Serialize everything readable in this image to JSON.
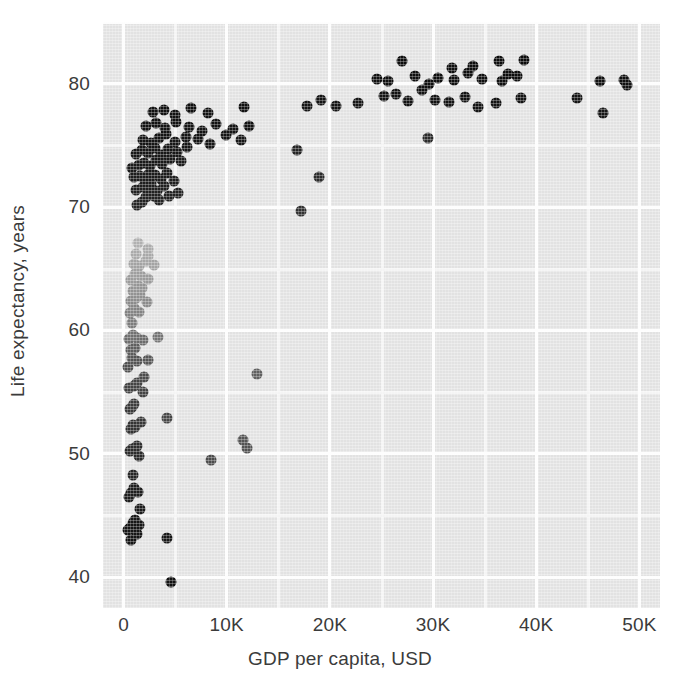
{
  "chart_data": {
    "type": "scatter",
    "title": "",
    "xlabel": "GDP per capita, USD",
    "ylabel": "Life expectancy, years",
    "xlim": [
      -2000,
      52000
    ],
    "ylim": [
      37.5,
      85
    ],
    "xticks": [
      0,
      10000,
      20000,
      30000,
      40000,
      50000
    ],
    "xticklabels": [
      "0",
      "10K",
      "20K",
      "30K",
      "40K",
      "50K"
    ],
    "yticks": [
      40,
      50,
      60,
      70,
      80
    ],
    "yticklabels": [
      "40",
      "50",
      "60",
      "70",
      "80"
    ],
    "x_minor_step": 5000,
    "y_minor_step": 5,
    "grid": true,
    "grid_color": "#fdfdfd",
    "plot_background": "#e2e2e2",
    "marker_size": 11,
    "legend": "none",
    "colormap": "grayscale: darker marker = higher life expectancy",
    "points": [
      {
        "x": 410,
        "y": 43.8,
        "c": "#151515"
      },
      {
        "x": 620,
        "y": 44.0,
        "c": "#161616"
      },
      {
        "x": 700,
        "y": 43.0,
        "c": "#151515"
      },
      {
        "x": 900,
        "y": 44.4,
        "c": "#161616"
      },
      {
        "x": 1150,
        "y": 44.6,
        "c": "#171717"
      },
      {
        "x": 1250,
        "y": 43.5,
        "c": "#151515"
      },
      {
        "x": 1500,
        "y": 44.2,
        "c": "#161616"
      },
      {
        "x": 1600,
        "y": 45.5,
        "c": "#1a1a1a"
      },
      {
        "x": 4200,
        "y": 43.2,
        "c": "#171717"
      },
      {
        "x": 4600,
        "y": 39.6,
        "c": "#131313"
      },
      {
        "x": 500,
        "y": 46.5,
        "c": "#1d1d1d"
      },
      {
        "x": 700,
        "y": 46.8,
        "c": "#1e1e1e"
      },
      {
        "x": 1000,
        "y": 47.2,
        "c": "#1f1f1f"
      },
      {
        "x": 1150,
        "y": 47.0,
        "c": "#1e1e1e"
      },
      {
        "x": 1350,
        "y": 46.9,
        "c": "#1e1e1e"
      },
      {
        "x": 900,
        "y": 48.3,
        "c": "#252525"
      },
      {
        "x": 1500,
        "y": 49.8,
        "c": "#2a2a2a"
      },
      {
        "x": 600,
        "y": 50.2,
        "c": "#2c2c2c"
      },
      {
        "x": 800,
        "y": 50.4,
        "c": "#2d2d2d"
      },
      {
        "x": 1250,
        "y": 50.6,
        "c": "#2d2d2d"
      },
      {
        "x": 8500,
        "y": 49.5,
        "c": "#4a4a4a"
      },
      {
        "x": 11600,
        "y": 51.1,
        "c": "#545454"
      },
      {
        "x": 12000,
        "y": 50.5,
        "c": "#525252"
      },
      {
        "x": 700,
        "y": 52.0,
        "c": "#333333"
      },
      {
        "x": 900,
        "y": 52.3,
        "c": "#343434"
      },
      {
        "x": 1100,
        "y": 52.2,
        "c": "#343434"
      },
      {
        "x": 1700,
        "y": 52.6,
        "c": "#373737"
      },
      {
        "x": 600,
        "y": 53.6,
        "c": "#3a3a3a"
      },
      {
        "x": 800,
        "y": 53.8,
        "c": "#3b3b3b"
      },
      {
        "x": 1000,
        "y": 54.0,
        "c": "#3c3c3c"
      },
      {
        "x": 4200,
        "y": 52.9,
        "c": "#464646"
      },
      {
        "x": 1900,
        "y": 55.0,
        "c": "#434343"
      },
      {
        "x": 500,
        "y": 55.3,
        "c": "#414141"
      },
      {
        "x": 1000,
        "y": 55.5,
        "c": "#434343"
      },
      {
        "x": 1300,
        "y": 55.7,
        "c": "#444444"
      },
      {
        "x": 2000,
        "y": 56.2,
        "c": "#4b4b4b"
      },
      {
        "x": 12900,
        "y": 56.5,
        "c": "#606060"
      },
      {
        "x": 450,
        "y": 57.0,
        "c": "#4e4e4e"
      },
      {
        "x": 800,
        "y": 57.8,
        "c": "#575757"
      },
      {
        "x": 1300,
        "y": 57.5,
        "c": "#535353"
      },
      {
        "x": 2400,
        "y": 57.6,
        "c": "#565656"
      },
      {
        "x": 700,
        "y": 58.4,
        "c": "#5d5d5d"
      },
      {
        "x": 1100,
        "y": 58.6,
        "c": "#5f5f5f"
      },
      {
        "x": 500,
        "y": 59.3,
        "c": "#6d6d6d"
      },
      {
        "x": 900,
        "y": 59.6,
        "c": "#727272"
      },
      {
        "x": 1300,
        "y": 59.4,
        "c": "#6f6f6f"
      },
      {
        "x": 1900,
        "y": 59.2,
        "c": "#6c6c6c"
      },
      {
        "x": 3300,
        "y": 59.5,
        "c": "#757575"
      },
      {
        "x": 800,
        "y": 60.6,
        "c": "#7d7d7d"
      },
      {
        "x": 600,
        "y": 61.4,
        "c": "#828282"
      },
      {
        "x": 1000,
        "y": 61.8,
        "c": "#868686"
      },
      {
        "x": 1500,
        "y": 61.5,
        "c": "#838383"
      },
      {
        "x": 700,
        "y": 62.4,
        "c": "#8a8a8a"
      },
      {
        "x": 1200,
        "y": 62.6,
        "c": "#8d8d8d"
      },
      {
        "x": 1600,
        "y": 62.9,
        "c": "#909090"
      },
      {
        "x": 2300,
        "y": 62.3,
        "c": "#8b8b8b"
      },
      {
        "x": 900,
        "y": 63.2,
        "c": "#939393"
      },
      {
        "x": 1400,
        "y": 63.6,
        "c": "#969696"
      },
      {
        "x": 1800,
        "y": 63.4,
        "c": "#949494"
      },
      {
        "x": 700,
        "y": 64.1,
        "c": "#9b9b9b"
      },
      {
        "x": 1100,
        "y": 64.6,
        "c": "#9f9f9f"
      },
      {
        "x": 1700,
        "y": 64.4,
        "c": "#9d9d9d"
      },
      {
        "x": 2400,
        "y": 64.2,
        "c": "#9b9b9b"
      },
      {
        "x": 1000,
        "y": 65.4,
        "c": "#a4a4a4"
      },
      {
        "x": 1500,
        "y": 65.2,
        "c": "#a2a2a2"
      },
      {
        "x": 2200,
        "y": 65.6,
        "c": "#a6a6a6"
      },
      {
        "x": 2900,
        "y": 65.3,
        "c": "#a3a3a3"
      },
      {
        "x": 1200,
        "y": 66.2,
        "c": "#aaaaaa"
      },
      {
        "x": 2400,
        "y": 66.0,
        "c": "#a8a8a8"
      },
      {
        "x": 1400,
        "y": 67.1,
        "c": "#b0b0b0"
      },
      {
        "x": 2400,
        "y": 66.6,
        "c": "#ababab"
      },
      {
        "x": 17200,
        "y": 69.7,
        "c": "#303030"
      },
      {
        "x": 1300,
        "y": 70.2,
        "c": "#262626"
      },
      {
        "x": 1800,
        "y": 70.4,
        "c": "#252525"
      },
      {
        "x": 2200,
        "y": 70.8,
        "c": "#232323"
      },
      {
        "x": 2900,
        "y": 70.9,
        "c": "#222222"
      },
      {
        "x": 3400,
        "y": 70.6,
        "c": "#232323"
      },
      {
        "x": 4400,
        "y": 70.9,
        "c": "#222222"
      },
      {
        "x": 1200,
        "y": 71.4,
        "c": "#212121"
      },
      {
        "x": 1900,
        "y": 71.6,
        "c": "#202020"
      },
      {
        "x": 2300,
        "y": 71.5,
        "c": "#202020"
      },
      {
        "x": 2700,
        "y": 71.9,
        "c": "#1f1f1f"
      },
      {
        "x": 3200,
        "y": 71.3,
        "c": "#212121"
      },
      {
        "x": 3900,
        "y": 71.7,
        "c": "#1f1f1f"
      },
      {
        "x": 5300,
        "y": 71.1,
        "c": "#222222"
      },
      {
        "x": 1000,
        "y": 72.4,
        "c": "#1d1d1d"
      },
      {
        "x": 1600,
        "y": 72.5,
        "c": "#1d1d1d"
      },
      {
        "x": 2100,
        "y": 72.2,
        "c": "#1e1e1e"
      },
      {
        "x": 2500,
        "y": 72.7,
        "c": "#1c1c1c"
      },
      {
        "x": 3000,
        "y": 72.6,
        "c": "#1c1c1c"
      },
      {
        "x": 3600,
        "y": 72.3,
        "c": "#1d1d1d"
      },
      {
        "x": 4200,
        "y": 72.8,
        "c": "#1c1c1c"
      },
      {
        "x": 4900,
        "y": 72.1,
        "c": "#1e1e1e"
      },
      {
        "x": 18900,
        "y": 72.4,
        "c": "#2b2b2b"
      },
      {
        "x": 800,
        "y": 73.2,
        "c": "#1b1b1b"
      },
      {
        "x": 1500,
        "y": 73.4,
        "c": "#1a1a1a"
      },
      {
        "x": 2000,
        "y": 73.6,
        "c": "#1a1a1a"
      },
      {
        "x": 2600,
        "y": 73.3,
        "c": "#1b1b1b"
      },
      {
        "x": 3100,
        "y": 73.8,
        "c": "#191919"
      },
      {
        "x": 3700,
        "y": 73.5,
        "c": "#1a1a1a"
      },
      {
        "x": 4500,
        "y": 73.9,
        "c": "#191919"
      },
      {
        "x": 5600,
        "y": 73.7,
        "c": "#1a1a1a"
      },
      {
        "x": 1200,
        "y": 74.3,
        "c": "#181818"
      },
      {
        "x": 1800,
        "y": 74.6,
        "c": "#171717"
      },
      {
        "x": 2400,
        "y": 74.4,
        "c": "#181818"
      },
      {
        "x": 3000,
        "y": 74.8,
        "c": "#171717"
      },
      {
        "x": 3600,
        "y": 74.2,
        "c": "#181818"
      },
      {
        "x": 4300,
        "y": 74.7,
        "c": "#171717"
      },
      {
        "x": 5200,
        "y": 74.5,
        "c": "#171717"
      },
      {
        "x": 6100,
        "y": 74.9,
        "c": "#161616"
      },
      {
        "x": 16800,
        "y": 74.6,
        "c": "#232323"
      },
      {
        "x": 29500,
        "y": 75.6,
        "c": "#2a2a2a"
      },
      {
        "x": 1900,
        "y": 75.4,
        "c": "#151515"
      },
      {
        "x": 2700,
        "y": 75.2,
        "c": "#151515"
      },
      {
        "x": 3400,
        "y": 75.6,
        "c": "#141414"
      },
      {
        "x": 4100,
        "y": 75.9,
        "c": "#141414"
      },
      {
        "x": 5000,
        "y": 75.3,
        "c": "#151515"
      },
      {
        "x": 6000,
        "y": 75.7,
        "c": "#141414"
      },
      {
        "x": 7200,
        "y": 75.5,
        "c": "#141414"
      },
      {
        "x": 8400,
        "y": 75.1,
        "c": "#151515"
      },
      {
        "x": 9900,
        "y": 75.8,
        "c": "#141414"
      },
      {
        "x": 11400,
        "y": 75.4,
        "c": "#151515"
      },
      {
        "x": 2200,
        "y": 76.6,
        "c": "#121212"
      },
      {
        "x": 3100,
        "y": 76.8,
        "c": "#121212"
      },
      {
        "x": 4000,
        "y": 76.4,
        "c": "#131313"
      },
      {
        "x": 5100,
        "y": 76.9,
        "c": "#121212"
      },
      {
        "x": 6300,
        "y": 76.5,
        "c": "#131313"
      },
      {
        "x": 7600,
        "y": 76.2,
        "c": "#131313"
      },
      {
        "x": 9000,
        "y": 76.7,
        "c": "#121212"
      },
      {
        "x": 10600,
        "y": 76.3,
        "c": "#131313"
      },
      {
        "x": 12200,
        "y": 76.6,
        "c": "#121212"
      },
      {
        "x": 2800,
        "y": 77.7,
        "c": "#111111"
      },
      {
        "x": 3900,
        "y": 77.9,
        "c": "#101010"
      },
      {
        "x": 5000,
        "y": 77.5,
        "c": "#111111"
      },
      {
        "x": 6500,
        "y": 78.0,
        "c": "#101010"
      },
      {
        "x": 8200,
        "y": 77.6,
        "c": "#111111"
      },
      {
        "x": 11700,
        "y": 78.1,
        "c": "#101010"
      },
      {
        "x": 17800,
        "y": 78.2,
        "c": "#141414"
      },
      {
        "x": 19100,
        "y": 78.7,
        "c": "#131313"
      },
      {
        "x": 20600,
        "y": 78.2,
        "c": "#141414"
      },
      {
        "x": 22700,
        "y": 78.4,
        "c": "#141414"
      },
      {
        "x": 25200,
        "y": 79.0,
        "c": "#121212"
      },
      {
        "x": 26400,
        "y": 79.2,
        "c": "#121212"
      },
      {
        "x": 27600,
        "y": 78.6,
        "c": "#131313"
      },
      {
        "x": 28900,
        "y": 79.5,
        "c": "#111111"
      },
      {
        "x": 30200,
        "y": 78.7,
        "c": "#121212"
      },
      {
        "x": 31500,
        "y": 78.5,
        "c": "#131313"
      },
      {
        "x": 33100,
        "y": 78.9,
        "c": "#121212"
      },
      {
        "x": 34400,
        "y": 78.1,
        "c": "#131313"
      },
      {
        "x": 36100,
        "y": 78.4,
        "c": "#131313"
      },
      {
        "x": 38500,
        "y": 78.8,
        "c": "#121212"
      },
      {
        "x": 44000,
        "y": 78.8,
        "c": "#141414"
      },
      {
        "x": 46500,
        "y": 77.6,
        "c": "#151515"
      },
      {
        "x": 48800,
        "y": 79.9,
        "c": "#131313"
      },
      {
        "x": 24600,
        "y": 80.4,
        "c": "#0f0f0f"
      },
      {
        "x": 25600,
        "y": 80.2,
        "c": "#0f0f0f"
      },
      {
        "x": 28200,
        "y": 80.6,
        "c": "#0e0e0e"
      },
      {
        "x": 29600,
        "y": 80.0,
        "c": "#0f0f0f"
      },
      {
        "x": 30500,
        "y": 80.5,
        "c": "#0e0e0e"
      },
      {
        "x": 32000,
        "y": 80.3,
        "c": "#0e0e0e"
      },
      {
        "x": 33400,
        "y": 80.9,
        "c": "#0d0d0d"
      },
      {
        "x": 34700,
        "y": 80.4,
        "c": "#0e0e0e"
      },
      {
        "x": 36700,
        "y": 80.2,
        "c": "#0f0f0f"
      },
      {
        "x": 38100,
        "y": 80.6,
        "c": "#0e0e0e"
      },
      {
        "x": 46200,
        "y": 80.2,
        "c": "#101010"
      },
      {
        "x": 48500,
        "y": 80.3,
        "c": "#0f0f0f"
      },
      {
        "x": 27000,
        "y": 81.8,
        "c": "#0c0c0c"
      },
      {
        "x": 31800,
        "y": 81.3,
        "c": "#0c0c0c"
      },
      {
        "x": 33900,
        "y": 81.4,
        "c": "#0c0c0c"
      },
      {
        "x": 36400,
        "y": 81.8,
        "c": "#0b0b0b"
      },
      {
        "x": 38800,
        "y": 81.9,
        "c": "#0b0b0b"
      },
      {
        "x": 37300,
        "y": 80.8,
        "c": "#0d0d0d"
      }
    ]
  }
}
